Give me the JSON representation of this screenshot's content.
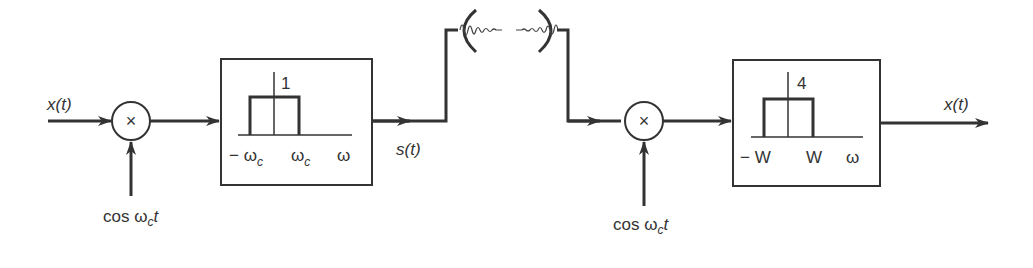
{
  "diagram": {
    "type": "signal-flow block diagram",
    "colors": {
      "stroke": "#333333",
      "background": "#ffffff"
    },
    "input_label": "x(t)",
    "output_label": "x(t)",
    "transmitter": {
      "mixer": {
        "symbol": "×",
        "carrier_label": {
          "prefix": "cos ω",
          "sub": "c",
          "suffix": "t"
        }
      },
      "filter": {
        "gain_label": "1",
        "tick_labels": {
          "neg": "− ω",
          "neg_sub": "c",
          "pos": "ω",
          "pos_sub": "c",
          "axis": "ω"
        }
      },
      "output_signal_label": "s(t)"
    },
    "channel": {
      "type": "wireless antenna link",
      "tx_antenna": "dish",
      "rx_antenna": "dish"
    },
    "receiver": {
      "mixer": {
        "symbol": "×",
        "carrier_label": {
          "prefix": "cos ω",
          "sub": "c",
          "suffix": "t"
        }
      },
      "filter": {
        "gain_label": "4",
        "tick_labels": {
          "neg": "− W",
          "pos": "W",
          "axis": "ω"
        }
      }
    }
  }
}
